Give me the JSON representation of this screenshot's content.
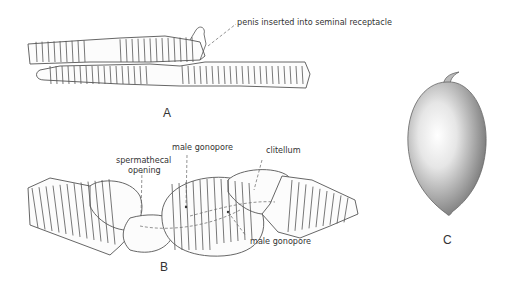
{
  "figure": {
    "panels": [
      {
        "id": "A",
        "label": "A",
        "annotations": [
          {
            "text": "penis inserted into seminal receptacle"
          }
        ]
      },
      {
        "id": "B",
        "label": "B",
        "annotations": [
          {
            "text": "male gonopore"
          },
          {
            "text": "clitellum"
          },
          {
            "text": "spermathecal"
          },
          {
            "text": "opening"
          },
          {
            "text": "male gonopore"
          }
        ]
      },
      {
        "id": "C",
        "label": "C",
        "annotations": []
      }
    ]
  }
}
